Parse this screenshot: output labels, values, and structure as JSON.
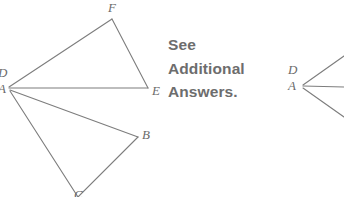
{
  "page": {
    "background_color": "#ffffff",
    "width": 344,
    "height": 197
  },
  "style": {
    "stroke_color": "#7d7d7d",
    "stroke_width": 1.1,
    "label_color": "#6b6b6b",
    "note_color": "#6d6d6d"
  },
  "note": {
    "lines": [
      "See",
      "Additional",
      "Answers."
    ],
    "full_text": "See Additional Answers."
  },
  "figures": [
    {
      "name": "left-figure",
      "description": "Two triangles sharing a common left vertex labeled D and A",
      "apex": {
        "x": 9,
        "y": 88,
        "labels": [
          "D",
          "A"
        ]
      },
      "vertices": [
        {
          "label": "D",
          "x": 9,
          "y": 88,
          "label_x": -2,
          "label_y": 66,
          "clipped": true
        },
        {
          "label": "A",
          "x": 9,
          "y": 88,
          "label_x": -2,
          "label_y": 82,
          "clipped": true
        },
        {
          "label": "F",
          "x": 112,
          "y": 19,
          "label_x": 108,
          "label_y": 1,
          "clipped": false
        },
        {
          "label": "E",
          "x": 148,
          "y": 88,
          "label_x": 152,
          "label_y": 84,
          "clipped": false
        },
        {
          "label": "B",
          "x": 138,
          "y": 137,
          "label_x": 142,
          "label_y": 128,
          "clipped": false
        },
        {
          "label": "C",
          "x": 78,
          "y": 196,
          "label_x": 74,
          "label_y": 188,
          "clipped": true
        }
      ],
      "edges": [
        {
          "from": "D",
          "to": "F"
        },
        {
          "from": "F",
          "to": "E"
        },
        {
          "from": "E",
          "to": "D"
        },
        {
          "from": "A",
          "to": "B"
        },
        {
          "from": "B",
          "to": "C"
        },
        {
          "from": "C",
          "to": "A"
        }
      ]
    },
    {
      "name": "right-figure",
      "description": "Partially visible mirrored figure; vertex labeled D and A with three rays exiting the right edge",
      "apex": {
        "x": 303,
        "y": 86,
        "labels": [
          "D",
          "A"
        ]
      },
      "vertices": [
        {
          "label": "D",
          "x": 303,
          "y": 86,
          "label_x": 288,
          "label_y": 63,
          "clipped": false
        },
        {
          "label": "A",
          "x": 303,
          "y": 86,
          "label_x": 288,
          "label_y": 79,
          "clipped": false
        }
      ],
      "rays": [
        {
          "from": "D",
          "to_x": 344,
          "to_y": 57
        },
        {
          "from": "A",
          "to_x": 344,
          "to_y": 86
        },
        {
          "from": "A",
          "to_x": 344,
          "to_y": 116
        }
      ]
    }
  ]
}
